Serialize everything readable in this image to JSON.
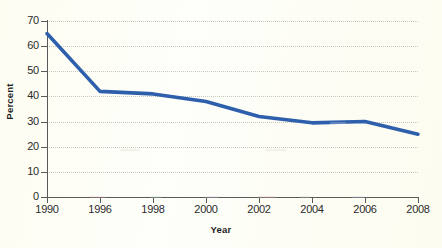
{
  "chart_data": {
    "type": "line",
    "title": "",
    "xlabel": "Year",
    "ylabel": "Percent",
    "categories": [
      "1990",
      "1996",
      "1998",
      "2000",
      "2002",
      "2004",
      "2006",
      "2008"
    ],
    "values": [
      65,
      42,
      41,
      38,
      32,
      29.5,
      30,
      25
    ],
    "series": [
      {
        "name": "Percent",
        "color": "#2e5fac",
        "values": [
          65,
          42,
          41,
          38,
          32,
          29.5,
          30,
          25
        ]
      }
    ],
    "ylim": [
      0,
      70
    ],
    "y_ticks": [
      "0",
      "10",
      "20",
      "30",
      "40",
      "50",
      "60",
      "70"
    ],
    "y_tick_values": [
      0,
      10,
      20,
      30,
      40,
      50,
      60,
      70
    ],
    "x_ticks": [
      "1990",
      "1996",
      "1998",
      "2000",
      "2002",
      "2004",
      "2006",
      "2008"
    ],
    "grid": "horizontal-dotted",
    "legend": "none",
    "line_width": 3.6,
    "background_color": "#fdfdf4",
    "axis_color": "#595959",
    "grid_color": "#c9c9c4",
    "text_color": "#2b2b2b"
  }
}
